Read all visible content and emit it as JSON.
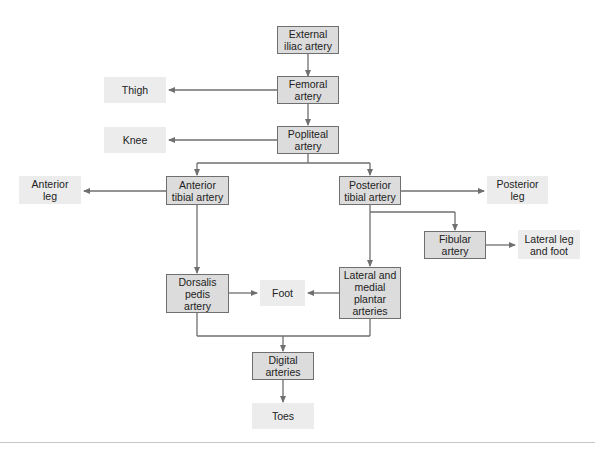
{
  "diagram": {
    "type": "flowchart",
    "colors": {
      "artery_fill": "#dcdcdc",
      "artery_border": "#6f6f6f",
      "region_fill": "#ececec",
      "line": "#6f6f6f"
    },
    "nodes": {
      "external_iliac": "External\niliac artery",
      "femoral": "Femoral\nartery",
      "thigh": "Thigh",
      "popliteal": "Popliteal\nartery",
      "knee": "Knee",
      "anterior_tibial": "Anterior\ntibial artery",
      "anterior_leg": "Anterior\nleg",
      "posterior_tibial": "Posterior\ntibial artery",
      "posterior_leg": "Posterior\nleg",
      "fibular": "Fibular\nartery",
      "lateral_leg_foot": "Lateral leg\nand foot",
      "dorsalis_pedis": "Dorsalis\npedis\nartery",
      "foot": "Foot",
      "plantar": "Lateral and\nmedial\nplantar\narteries",
      "digital": "Digital\narteries",
      "toes": "Toes"
    },
    "edges": [
      [
        "external_iliac",
        "femoral"
      ],
      [
        "femoral",
        "thigh"
      ],
      [
        "femoral",
        "popliteal"
      ],
      [
        "popliteal",
        "knee"
      ],
      [
        "popliteal",
        "anterior_tibial"
      ],
      [
        "popliteal",
        "posterior_tibial"
      ],
      [
        "anterior_tibial",
        "anterior_leg"
      ],
      [
        "anterior_tibial",
        "dorsalis_pedis"
      ],
      [
        "posterior_tibial",
        "posterior_leg"
      ],
      [
        "posterior_tibial",
        "fibular"
      ],
      [
        "posterior_tibial",
        "plantar"
      ],
      [
        "fibular",
        "lateral_leg_foot"
      ],
      [
        "dorsalis_pedis",
        "foot"
      ],
      [
        "plantar",
        "foot"
      ],
      [
        "dorsalis_pedis",
        "digital"
      ],
      [
        "plantar",
        "digital"
      ],
      [
        "digital",
        "toes"
      ]
    ]
  }
}
